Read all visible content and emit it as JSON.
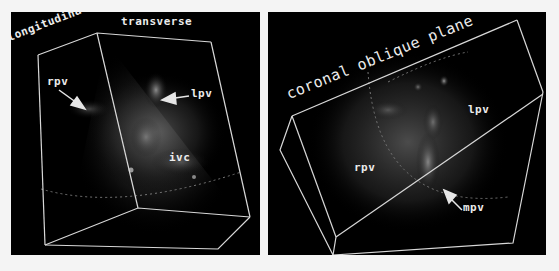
{
  "figure": {
    "background": "#f4f4f4",
    "panel_background": "#000000",
    "line_color": "#d8d8d8",
    "label_color": "#ececec",
    "panels": [
      {
        "id": "left",
        "plane_labels": [
          "longitudinal",
          "transverse"
        ],
        "annotations": [
          {
            "text": "rpv",
            "arrow": true
          },
          {
            "text": "lpv",
            "arrow": true
          },
          {
            "text": "ivc",
            "arrow": false
          }
        ]
      },
      {
        "id": "right",
        "plane_labels": [
          "coronal oblique plane"
        ],
        "annotations": [
          {
            "text": "lpv",
            "arrow": false
          },
          {
            "text": "rpv",
            "arrow": false
          },
          {
            "text": "mpv",
            "arrow": true
          }
        ]
      }
    ]
  }
}
